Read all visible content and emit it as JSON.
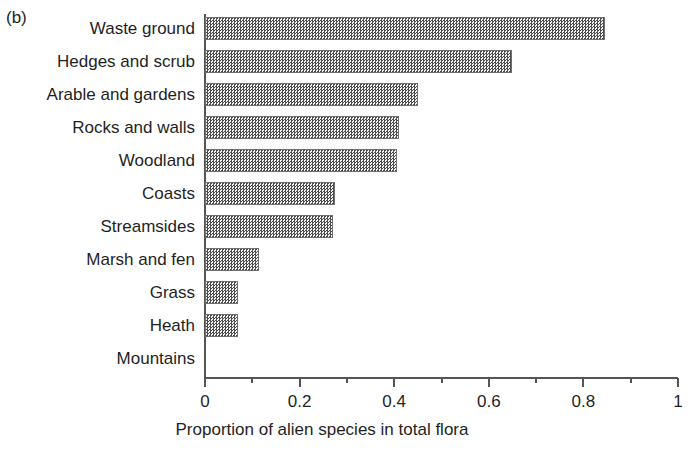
{
  "figure": {
    "panel_label": "(b)"
  },
  "chart_data": {
    "type": "bar",
    "orientation": "horizontal",
    "title": "",
    "xlabel": "Proportion of alien species in total flora",
    "ylabel": "",
    "xlim": [
      0,
      1
    ],
    "grid": false,
    "legend": null,
    "categories": [
      "Waste ground",
      "Hedges and scrub",
      "Arable and gardens",
      "Rocks and walls",
      "Woodland",
      "Coasts",
      "Streamsides",
      "Marsh and fen",
      "Grass",
      "Heath",
      "Mountains"
    ],
    "values": [
      0.845,
      0.65,
      0.45,
      0.41,
      0.405,
      0.275,
      0.27,
      0.115,
      0.07,
      0.07,
      0.0
    ],
    "xticks": [
      0,
      0.2,
      0.4,
      0.6,
      0.8,
      1
    ],
    "xtick_labels": [
      "0",
      "0.2",
      "0.4",
      "0.6",
      "0.8",
      "1"
    ],
    "xminor_ticks": [
      0.1,
      0.3,
      0.5,
      0.7,
      0.9
    ],
    "bar_fill": "#4d4d4d",
    "bar_edge": "#6f6f6f",
    "axis_color": "#555555"
  }
}
